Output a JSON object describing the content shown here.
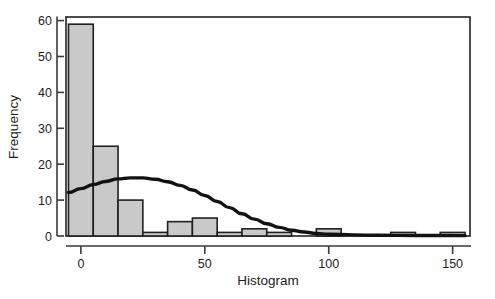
{
  "chart_data": {
    "type": "bar",
    "title": "",
    "subtitle": "",
    "xlabel": "Histogram",
    "ylabel": "Frequency",
    "xlim": [
      -6,
      157
    ],
    "ylim": [
      0,
      61
    ],
    "grid": false,
    "legend": null,
    "xticks": [
      0,
      50,
      100,
      150
    ],
    "xticklabels": [
      "0",
      "50",
      "100",
      "150"
    ],
    "yticks": [
      0,
      10,
      20,
      30,
      40,
      50,
      60
    ],
    "yticklabels": [
      "0",
      "10",
      "20",
      "30",
      "40",
      "50",
      "60"
    ],
    "bin_width": 10,
    "bars": [
      {
        "bin_start": -5,
        "bin_end": 5,
        "value": 59
      },
      {
        "bin_start": 5,
        "bin_end": 15,
        "value": 25
      },
      {
        "bin_start": 15,
        "bin_end": 25,
        "value": 10
      },
      {
        "bin_start": 25,
        "bin_end": 35,
        "value": 1
      },
      {
        "bin_start": 35,
        "bin_end": 45,
        "value": 4
      },
      {
        "bin_start": 45,
        "bin_end": 55,
        "value": 5
      },
      {
        "bin_start": 55,
        "bin_end": 65,
        "value": 1
      },
      {
        "bin_start": 65,
        "bin_end": 75,
        "value": 2
      },
      {
        "bin_start": 75,
        "bin_end": 85,
        "value": 1
      },
      {
        "bin_start": 85,
        "bin_end": 95,
        "value": 0
      },
      {
        "bin_start": 95,
        "bin_end": 105,
        "value": 2
      },
      {
        "bin_start": 105,
        "bin_end": 115,
        "value": 0
      },
      {
        "bin_start": 115,
        "bin_end": 125,
        "value": 0
      },
      {
        "bin_start": 125,
        "bin_end": 135,
        "value": 1
      },
      {
        "bin_start": 135,
        "bin_end": 145,
        "value": 0
      },
      {
        "bin_start": 145,
        "bin_end": 155,
        "value": 1
      }
    ],
    "overlay_curve": {
      "name": "normal-curve",
      "color": "#121212",
      "points": [
        {
          "x": -5,
          "y": 12.1
        },
        {
          "x": 0,
          "y": 13.2
        },
        {
          "x": 5,
          "y": 14.3
        },
        {
          "x": 10,
          "y": 15.2
        },
        {
          "x": 15,
          "y": 15.9
        },
        {
          "x": 20,
          "y": 16.2
        },
        {
          "x": 25,
          "y": 16.2
        },
        {
          "x": 30,
          "y": 15.8
        },
        {
          "x": 35,
          "y": 15.1
        },
        {
          "x": 40,
          "y": 14.1
        },
        {
          "x": 45,
          "y": 12.8
        },
        {
          "x": 50,
          "y": 11.3
        },
        {
          "x": 55,
          "y": 9.6
        },
        {
          "x": 60,
          "y": 7.9
        },
        {
          "x": 65,
          "y": 6.2
        },
        {
          "x": 70,
          "y": 4.7
        },
        {
          "x": 75,
          "y": 3.4
        },
        {
          "x": 80,
          "y": 2.4
        },
        {
          "x": 85,
          "y": 1.6
        },
        {
          "x": 90,
          "y": 1.1
        },
        {
          "x": 95,
          "y": 0.7
        },
        {
          "x": 100,
          "y": 0.5
        },
        {
          "x": 110,
          "y": 0.3
        },
        {
          "x": 120,
          "y": 0.2
        },
        {
          "x": 135,
          "y": 0.15
        },
        {
          "x": 155,
          "y": 0.1
        }
      ]
    }
  }
}
